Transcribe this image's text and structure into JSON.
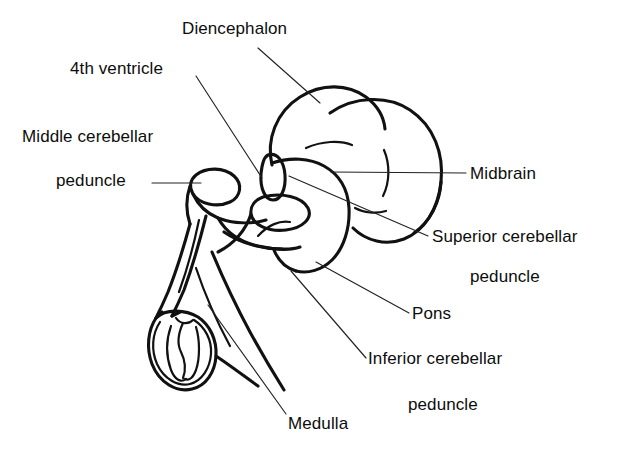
{
  "figure": {
    "background_color": "#ffffff",
    "stroke_color": "#111111",
    "leader_color": "#222222",
    "width": 638,
    "height": 451
  },
  "labels": [
    {
      "id": "diencephalon",
      "text": "Diencephalon",
      "x": 182,
      "y": 20
    },
    {
      "id": "fourth-ventricle",
      "text": "4th ventricle",
      "x": 70,
      "y": 60
    },
    {
      "id": "middle-cerebellar",
      "text": "Middle cerebellar",
      "x": 22,
      "y": 128
    },
    {
      "id": "middle-peduncle",
      "text": "peduncle",
      "x": 56,
      "y": 172
    },
    {
      "id": "midbrain",
      "text": "Midbrain",
      "x": 470,
      "y": 165
    },
    {
      "id": "superior-cerebellar",
      "text": "Superior cerebellar",
      "x": 432,
      "y": 228
    },
    {
      "id": "superior-peduncle",
      "text": "peduncle",
      "x": 470,
      "y": 268
    },
    {
      "id": "pons",
      "text": "Pons",
      "x": 412,
      "y": 305
    },
    {
      "id": "inferior-cerebellar",
      "text": "Inferior cerebellar",
      "x": 368,
      "y": 350
    },
    {
      "id": "inferior-peduncle",
      "text": "peduncle",
      "x": 408,
      "y": 396
    },
    {
      "id": "medulla",
      "text": "Medulla",
      "x": 288,
      "y": 415
    }
  ],
  "leaders": [
    {
      "id": "leader-diencephalon",
      "d": "M 258 48 L 320 103"
    },
    {
      "id": "leader-fourth-ventricle",
      "d": "M 196 76 L 262 178"
    },
    {
      "id": "leader-middle-peduncle",
      "d": "M 152 183 L 201 183"
    },
    {
      "id": "leader-midbrain",
      "d": "M 331 172 L 466 173"
    },
    {
      "id": "leader-superior-cerebellar",
      "d": "M 289 176 L 428 236"
    },
    {
      "id": "leader-pons",
      "d": "M 316 262 L 409 313"
    },
    {
      "id": "leader-inferior-cerebellar",
      "d": "M 291 271 L 366 358"
    },
    {
      "id": "leader-medulla",
      "d": "M 208 305 L 286 414"
    }
  ],
  "anatomy": {
    "diencephalon_lobe": "M 272 165 C 266 140, 276 112, 300 97 C 322 83, 348 84, 366 97 C 378 106, 384 118, 385 129",
    "midbrain_lobe": "M 330 113 C 354 96, 388 95, 410 110 C 434 126, 444 154, 441 182 C 438 210, 424 231, 404 239 C 386 246, 366 241, 353 228",
    "midbrain_lower": "M 441 182 C 440 202, 430 222, 414 233",
    "cerebellum_fold_upper": "M 306 148 C 322 141, 340 140, 352 145",
    "cerebellum_fold_inner": "M 384 150 C 390 164, 390 182, 383 196",
    "midbrain_fold_low": "M 355 208 C 364 213, 376 214, 386 211",
    "pons_body": "M 272 163 C 290 157, 310 158, 324 166 C 340 175, 348 190, 349 208 C 350 228, 344 248, 332 260 C 322 270, 308 274, 296 271",
    "pons_lower_edge": "M 296 271 C 286 268, 278 260, 274 250",
    "pons_fold": "M 258 236 C 268 225, 280 220, 290 222",
    "mcp_oval": "M 196 175 C 206 167, 224 167, 234 176 C 243 184, 241 197, 230 202 C 217 208, 199 204, 193 194 C 189 187, 190 180, 196 175 Z",
    "scp_oval": "M 268 155 C 277 152, 284 161, 285 175 C 286 189, 281 200, 273 200 C 265 200, 260 188, 261 174 C 262 163, 264 157, 268 155 Z",
    "icp_oval": "M 263 197 C 282 192, 302 197, 308 208 C 313 218, 303 228, 286 230 C 268 232, 253 225, 251 214 C 250 206, 255 200, 263 197 Z",
    "brainstem_upper_edge": "M 193 194 C 198 205, 206 213, 218 218 C 234 224, 252 224, 266 220",
    "brainstem_left_edge": "M 190 186 C 186 198, 186 212, 190 224",
    "cord_outer": "M 190 224 C 184 246, 176 272, 168 292 C 162 306, 158 314, 156 318",
    "cord_inner": "M 206 216 C 200 240, 192 268, 184 290 C 178 304, 174 312, 172 316",
    "cord_mid": "M 199 220 C 194 244, 187 270, 179 292",
    "ventral_fold": "M 218 218 C 226 232, 240 242, 258 246 C 276 250, 292 250, 300 247",
    "ventral_fold2": "M 224 232 C 240 243, 262 249, 282 249",
    "medulla_caudal": "M 251 214 C 246 230, 234 244, 218 252",
    "medulla_body": "M 212 252 C 222 276, 236 306, 250 332 C 262 354, 274 374, 284 390",
    "medulla_body2": "M 196 268 C 204 292, 216 320, 230 346",
    "cut_outer": "M 156 318 C 148 330, 146 348, 152 364 C 159 382, 176 393, 192 389 C 206 386, 215 372, 216 356 C 217 340, 210 325, 198 317 C 186 310, 166 308, 156 318 Z",
    "cut_rim": "M 160 322 C 152 334, 151 350, 157 364 C 164 379, 178 387, 190 384 C 202 381, 210 368, 211 354 C 212 340, 205 327, 194 320",
    "cut_h_left": "M 171 326 C 166 340, 166 356, 171 370 C 175 380, 181 383, 186 379",
    "cut_h_center": "M 183 323 C 178 334, 177 344, 181 352 C 185 360, 186 370, 183 378",
    "cut_h_right": "M 196 327 C 200 340, 200 358, 196 370 C 193 378, 189 381, 185 379",
    "cut_notch": "M 176 318 C 180 324, 188 325, 193 320",
    "cord_to_cut_left": "M 156 318 L 162 312",
    "cord_to_cut_right": "M 172 316 L 180 312",
    "caudal_tail": "M 216 356 C 228 364, 244 376, 258 386"
  }
}
